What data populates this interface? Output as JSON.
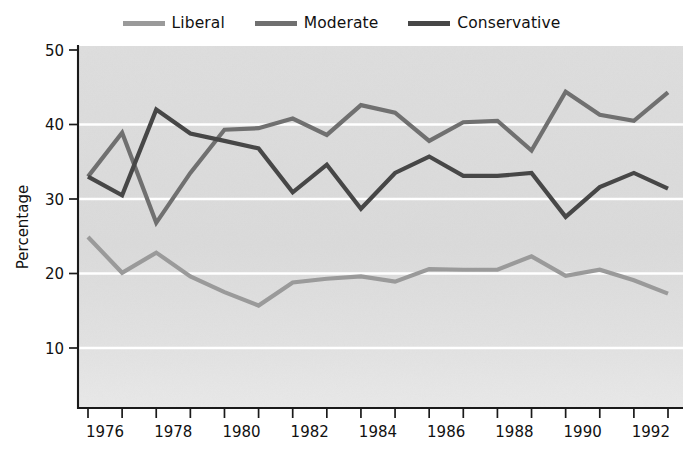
{
  "legend": {
    "position": "top-center",
    "items": [
      {
        "label": "Liberal",
        "color": "#9a9a9a",
        "icon": "line-swatch-icon"
      },
      {
        "label": "Moderate",
        "color": "#707070",
        "icon": "line-swatch-icon"
      },
      {
        "label": "Conservative",
        "color": "#474747",
        "icon": "line-swatch-icon"
      }
    ]
  },
  "axes": {
    "ylabel": "Percentage",
    "xlabel": "",
    "yticks": [
      "10",
      "20",
      "30",
      "40",
      "50"
    ],
    "xticks_labeled": [
      "1976",
      "1978",
      "1980",
      "1982",
      "1984",
      "1986",
      "1988",
      "1990",
      "1992"
    ]
  },
  "style": {
    "plot_background": "#dcdcdc",
    "gridline_color": "#ffffff",
    "axis_color": "#1a1a1a",
    "page_background": "#ffffff"
  },
  "chart_data": {
    "type": "line",
    "title": "",
    "xlabel": "",
    "ylabel": "Percentage",
    "xlim": [
      1976,
      1993
    ],
    "ylim": [
      4,
      50
    ],
    "yticks": [
      10,
      20,
      30,
      40,
      50
    ],
    "xticks": [
      1976,
      1977,
      1978,
      1979,
      1980,
      1981,
      1982,
      1983,
      1984,
      1985,
      1986,
      1987,
      1988,
      1989,
      1990,
      1991,
      1992,
      1993
    ],
    "xtick_labels": [
      "1976",
      "",
      "1978",
      "",
      "1980",
      "",
      "1982",
      "",
      "1984",
      "",
      "1986",
      "",
      "1988",
      "",
      "1990",
      "",
      "1992",
      ""
    ],
    "grid": "horizontal",
    "legend_position": "top-center",
    "x": [
      1976,
      1977,
      1978,
      1979,
      1980,
      1981,
      1982,
      1983,
      1984,
      1985,
      1986,
      1987,
      1988,
      1989,
      1990,
      1991,
      1992,
      1993
    ],
    "series": [
      {
        "name": "Liberal",
        "color": "#9a9a9a",
        "values": [
          24.9,
          20.1,
          22.8,
          19.6,
          17.5,
          15.7,
          18.8,
          19.3,
          19.6,
          18.9,
          20.6,
          20.5,
          20.5,
          22.3,
          19.7,
          20.5,
          19.1,
          17.3
        ]
      },
      {
        "name": "Moderate",
        "color": "#707070",
        "values": [
          33.0,
          38.9,
          26.8,
          33.5,
          39.3,
          39.5,
          40.8,
          38.6,
          42.6,
          41.6,
          37.8,
          40.3,
          40.5,
          36.5,
          44.4,
          41.3,
          40.5,
          44.3
        ]
      },
      {
        "name": "Conservative",
        "color": "#474747",
        "values": [
          33.0,
          30.5,
          42.0,
          38.8,
          37.8,
          36.8,
          30.9,
          34.6,
          28.7,
          33.5,
          35.7,
          33.1,
          33.1,
          33.5,
          27.6,
          31.6,
          33.5,
          31.4
        ]
      }
    ]
  }
}
